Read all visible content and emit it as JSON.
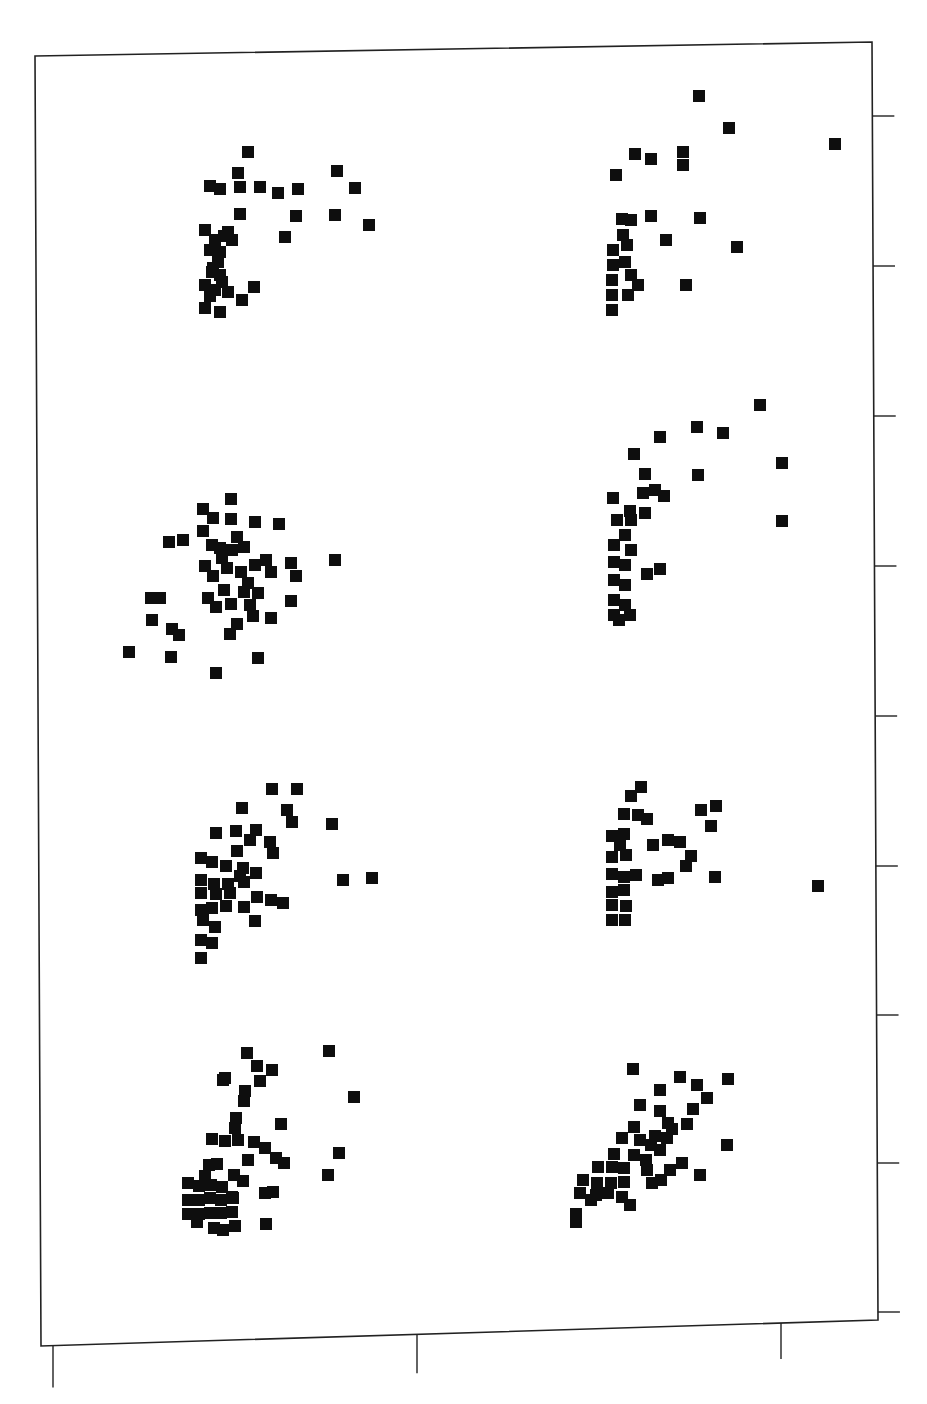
{
  "chart_data": {
    "type": "scatter",
    "title": "",
    "subtitle": "",
    "xlabel": "",
    "ylabel": "",
    "legend": [],
    "grid": false,
    "layout": {
      "panels_rows": 4,
      "panels_cols": 2,
      "marker": "filled-square",
      "marker_color": "#0e0e0e",
      "frame": {
        "x0": 35,
        "y0": 42,
        "x1": 878,
        "y1": 1330
      },
      "x_ticks_px": [
        53,
        417,
        781
      ],
      "y_ticks_px": [
        116,
        266,
        416,
        566,
        716,
        866,
        1015,
        1163,
        1312
      ],
      "tick_labels_visible": false,
      "coordinate_note": "Point positions estimated in screenshot pixel coordinates."
    },
    "panels": [
      {
        "row": 1,
        "col": 1,
        "points": [
          [
            248,
            152
          ],
          [
            238,
            173
          ],
          [
            210,
            186
          ],
          [
            220,
            189
          ],
          [
            240,
            187
          ],
          [
            260,
            187
          ],
          [
            278,
            193
          ],
          [
            298,
            189
          ],
          [
            337,
            171
          ],
          [
            355,
            188
          ],
          [
            240,
            214
          ],
          [
            296,
            216
          ],
          [
            335,
            215
          ],
          [
            369,
            225
          ],
          [
            285,
            237
          ],
          [
            205,
            230
          ],
          [
            228,
            232
          ],
          [
            215,
            240
          ],
          [
            224,
            236
          ],
          [
            210,
            250
          ],
          [
            220,
            252
          ],
          [
            232,
            240
          ],
          [
            212,
            272
          ],
          [
            220,
            275
          ],
          [
            205,
            285
          ],
          [
            215,
            290
          ],
          [
            222,
            282
          ],
          [
            210,
            296
          ],
          [
            228,
            292
          ],
          [
            205,
            308
          ],
          [
            220,
            312
          ],
          [
            242,
            300
          ],
          [
            254,
            287
          ],
          [
            213,
            268
          ],
          [
            218,
            262
          ]
        ]
      },
      {
        "row": 1,
        "col": 2,
        "points": [
          [
            699,
            96
          ],
          [
            729,
            128
          ],
          [
            835,
            144
          ],
          [
            635,
            154
          ],
          [
            651,
            159
          ],
          [
            683,
            152
          ],
          [
            683,
            165
          ],
          [
            616,
            175
          ],
          [
            622,
            219
          ],
          [
            631,
            220
          ],
          [
            651,
            216
          ],
          [
            700,
            218
          ],
          [
            623,
            235
          ],
          [
            666,
            240
          ],
          [
            737,
            247
          ],
          [
            613,
            250
          ],
          [
            627,
            245
          ],
          [
            613,
            265
          ],
          [
            625,
            262
          ],
          [
            612,
            280
          ],
          [
            631,
            275
          ],
          [
            638,
            285
          ],
          [
            612,
            295
          ],
          [
            628,
            295
          ],
          [
            612,
            310
          ],
          [
            686,
            285
          ]
        ]
      },
      {
        "row": 2,
        "col": 1,
        "points": [
          [
            231,
            499
          ],
          [
            203,
            509
          ],
          [
            213,
            518
          ],
          [
            231,
            519
          ],
          [
            255,
            522
          ],
          [
            279,
            524
          ],
          [
            169,
            542
          ],
          [
            183,
            540
          ],
          [
            203,
            531
          ],
          [
            212,
            545
          ],
          [
            237,
            537
          ],
          [
            244,
            547
          ],
          [
            222,
            558
          ],
          [
            205,
            566
          ],
          [
            213,
            576
          ],
          [
            227,
            568
          ],
          [
            241,
            572
          ],
          [
            255,
            565
          ],
          [
            266,
            560
          ],
          [
            271,
            572
          ],
          [
            291,
            563
          ],
          [
            296,
            576
          ],
          [
            335,
            560
          ],
          [
            208,
            598
          ],
          [
            224,
            590
          ],
          [
            216,
            607
          ],
          [
            244,
            592
          ],
          [
            258,
            593
          ],
          [
            231,
            604
          ],
          [
            250,
            605
          ],
          [
            253,
            616
          ],
          [
            271,
            618
          ],
          [
            291,
            601
          ],
          [
            151,
            598
          ],
          [
            160,
            598
          ],
          [
            152,
            620
          ],
          [
            172,
            629
          ],
          [
            179,
            635
          ],
          [
            230,
            634
          ],
          [
            237,
            624
          ],
          [
            129,
            652
          ],
          [
            171,
            657
          ],
          [
            258,
            658
          ],
          [
            216,
            673
          ],
          [
            220,
            548
          ],
          [
            232,
            550
          ],
          [
            248,
            583
          ]
        ]
      },
      {
        "row": 2,
        "col": 2,
        "points": [
          [
            760,
            405
          ],
          [
            697,
            427
          ],
          [
            723,
            433
          ],
          [
            660,
            437
          ],
          [
            634,
            454
          ],
          [
            645,
            474
          ],
          [
            698,
            475
          ],
          [
            782,
            463
          ],
          [
            782,
            521
          ],
          [
            613,
            498
          ],
          [
            643,
            493
          ],
          [
            655,
            490
          ],
          [
            664,
            496
          ],
          [
            630,
            511
          ],
          [
            645,
            513
          ],
          [
            617,
            520
          ],
          [
            631,
            520
          ],
          [
            625,
            535
          ],
          [
            631,
            550
          ],
          [
            614,
            545
          ],
          [
            614,
            562
          ],
          [
            625,
            565
          ],
          [
            647,
            574
          ],
          [
            660,
            569
          ],
          [
            614,
            580
          ],
          [
            625,
            585
          ],
          [
            614,
            600
          ],
          [
            625,
            605
          ],
          [
            614,
            615
          ],
          [
            630,
            615
          ],
          [
            619,
            620
          ]
        ]
      },
      {
        "row": 3,
        "col": 1,
        "points": [
          [
            272,
            789
          ],
          [
            297,
            789
          ],
          [
            242,
            808
          ],
          [
            287,
            810
          ],
          [
            292,
            822
          ],
          [
            332,
            824
          ],
          [
            216,
            833
          ],
          [
            236,
            831
          ],
          [
            256,
            830
          ],
          [
            250,
            840
          ],
          [
            237,
            851
          ],
          [
            270,
            842
          ],
          [
            273,
            853
          ],
          [
            201,
            858
          ],
          [
            212,
            862
          ],
          [
            226,
            866
          ],
          [
            243,
            868
          ],
          [
            240,
            876
          ],
          [
            256,
            873
          ],
          [
            201,
            880
          ],
          [
            214,
            884
          ],
          [
            228,
            884
          ],
          [
            244,
            882
          ],
          [
            201,
            893
          ],
          [
            216,
            894
          ],
          [
            230,
            893
          ],
          [
            257,
            897
          ],
          [
            271,
            900
          ],
          [
            283,
            903
          ],
          [
            201,
            910
          ],
          [
            212,
            908
          ],
          [
            226,
            906
          ],
          [
            244,
            907
          ],
          [
            203,
            920
          ],
          [
            215,
            927
          ],
          [
            255,
            921
          ],
          [
            201,
            940
          ],
          [
            212,
            943
          ],
          [
            201,
            958
          ],
          [
            343,
            880
          ],
          [
            372,
            878
          ]
        ]
      },
      {
        "row": 4,
        "col": 1,
        "points": [
          [
            247,
            1053
          ],
          [
            329,
            1051
          ],
          [
            257,
            1066
          ],
          [
            272,
            1070
          ],
          [
            225,
            1078
          ],
          [
            223,
            1080
          ],
          [
            260,
            1081
          ],
          [
            245,
            1091
          ],
          [
            244,
            1101
          ],
          [
            354,
            1097
          ],
          [
            236,
            1118
          ],
          [
            235,
            1128
          ],
          [
            281,
            1124
          ],
          [
            212,
            1139
          ],
          [
            225,
            1141
          ],
          [
            238,
            1140
          ],
          [
            254,
            1142
          ],
          [
            265,
            1148
          ],
          [
            276,
            1158
          ],
          [
            284,
            1163
          ],
          [
            339,
            1153
          ],
          [
            209,
            1165
          ],
          [
            217,
            1164
          ],
          [
            248,
            1160
          ],
          [
            205,
            1176
          ],
          [
            234,
            1175
          ],
          [
            328,
            1175
          ],
          [
            188,
            1183
          ],
          [
            199,
            1186
          ],
          [
            211,
            1185
          ],
          [
            222,
            1187
          ],
          [
            243,
            1181
          ],
          [
            265,
            1193
          ],
          [
            273,
            1192
          ],
          [
            188,
            1200
          ],
          [
            199,
            1200
          ],
          [
            210,
            1198
          ],
          [
            221,
            1200
          ],
          [
            232,
            1197
          ],
          [
            188,
            1214
          ],
          [
            199,
            1214
          ],
          [
            210,
            1213
          ],
          [
            221,
            1213
          ],
          [
            232,
            1212
          ],
          [
            197,
            1222
          ],
          [
            214,
            1228
          ],
          [
            223,
            1230
          ],
          [
            235,
            1226
          ],
          [
            266,
            1224
          ],
          [
            233,
            1198
          ]
        ]
      },
      {
        "row": 3,
        "col": 2,
        "points": [
          [
            641,
            787
          ],
          [
            631,
            796
          ],
          [
            624,
            814
          ],
          [
            638,
            815
          ],
          [
            647,
            819
          ],
          [
            701,
            810
          ],
          [
            716,
            806
          ],
          [
            711,
            826
          ],
          [
            612,
            836
          ],
          [
            624,
            834
          ],
          [
            620,
            845
          ],
          [
            612,
            857
          ],
          [
            626,
            855
          ],
          [
            653,
            845
          ],
          [
            668,
            840
          ],
          [
            680,
            842
          ],
          [
            691,
            856
          ],
          [
            686,
            866
          ],
          [
            612,
            874
          ],
          [
            624,
            877
          ],
          [
            636,
            875
          ],
          [
            658,
            880
          ],
          [
            668,
            878
          ],
          [
            715,
            877
          ],
          [
            612,
            892
          ],
          [
            624,
            890
          ],
          [
            612,
            905
          ],
          [
            626,
            906
          ],
          [
            612,
            920
          ],
          [
            625,
            920
          ],
          [
            818,
            886
          ]
        ]
      },
      {
        "row": 4,
        "col": 2,
        "points": [
          [
            633,
            1069
          ],
          [
            680,
            1077
          ],
          [
            697,
            1085
          ],
          [
            728,
            1079
          ],
          [
            660,
            1090
          ],
          [
            707,
            1098
          ],
          [
            693,
            1109
          ],
          [
            640,
            1105
          ],
          [
            660,
            1111
          ],
          [
            668,
            1123
          ],
          [
            634,
            1127
          ],
          [
            672,
            1129
          ],
          [
            687,
            1124
          ],
          [
            655,
            1136
          ],
          [
            622,
            1138
          ],
          [
            640,
            1140
          ],
          [
            651,
            1145
          ],
          [
            667,
            1138
          ],
          [
            727,
            1145
          ],
          [
            614,
            1154
          ],
          [
            634,
            1155
          ],
          [
            660,
            1150
          ],
          [
            646,
            1160
          ],
          [
            682,
            1163
          ],
          [
            700,
            1175
          ],
          [
            598,
            1167
          ],
          [
            612,
            1167
          ],
          [
            624,
            1168
          ],
          [
            647,
            1170
          ],
          [
            670,
            1170
          ],
          [
            583,
            1180
          ],
          [
            597,
            1183
          ],
          [
            611,
            1183
          ],
          [
            624,
            1182
          ],
          [
            652,
            1183
          ],
          [
            661,
            1180
          ],
          [
            596,
            1195
          ],
          [
            608,
            1193
          ],
          [
            622,
            1197
          ],
          [
            580,
            1193
          ],
          [
            591,
            1200
          ],
          [
            630,
            1205
          ],
          [
            576,
            1222
          ],
          [
            576,
            1214
          ]
        ]
      }
    ]
  },
  "footer": {
    "text_visible": "illegible scanned text (cropped)"
  }
}
